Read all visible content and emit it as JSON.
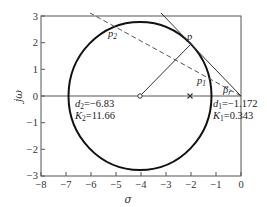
{
  "figure": {
    "type": "root-locus",
    "xlabel": "σ",
    "ylabel": "jω",
    "xlim": [
      -8,
      0
    ],
    "ylim": [
      -3,
      3
    ],
    "x_ticks": [
      "−8",
      "−7",
      "−6",
      "−5",
      "−4",
      "−3",
      "−2",
      "−1",
      "0"
    ],
    "y_ticks": [
      "3",
      "2",
      "1",
      "0",
      "−1",
      "−2",
      "−3"
    ],
    "circle": {
      "center": [
        -4,
        0
      ],
      "radius": 2.828
    },
    "zero": {
      "sigma": -4,
      "symbol": "o"
    },
    "pole": {
      "sigma": -2,
      "symbol": "×"
    },
    "points": {
      "p": "p",
      "p1": "p",
      "p1_sub": "1",
      "p2": "p",
      "p2_sub": "2",
      "beta": "β",
      "beta_sub": "r"
    },
    "annotations": {
      "left": {
        "d_label": "d",
        "d_sub": "2",
        "d_value": "=−6.83",
        "k_label": "K",
        "k_sub": "2",
        "k_value": "=11.66"
      },
      "right": {
        "d_label": "d",
        "d_sub": "1",
        "d_value": "=−1.172",
        "k_label": "K",
        "k_sub": "1",
        "k_value": "=0.343"
      }
    },
    "colors": {
      "axis": "#555555",
      "curve": "#111111",
      "line": "#333333",
      "dashed": "#555555"
    }
  }
}
